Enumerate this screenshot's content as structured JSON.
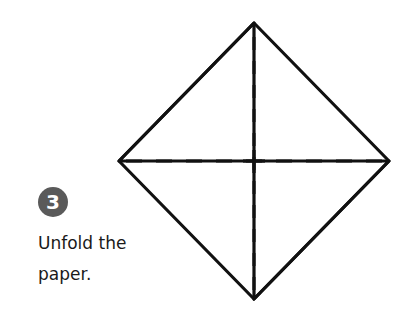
{
  "step": {
    "number": "3",
    "instruction_line1": "Unfold the",
    "instruction_line2": "paper."
  },
  "diagram": {
    "shape": "diamond",
    "fold_lines": [
      "vertical-dashed",
      "horizontal-dashed"
    ],
    "stroke_color": "#111111",
    "badge_color": "#5a5a5a"
  }
}
